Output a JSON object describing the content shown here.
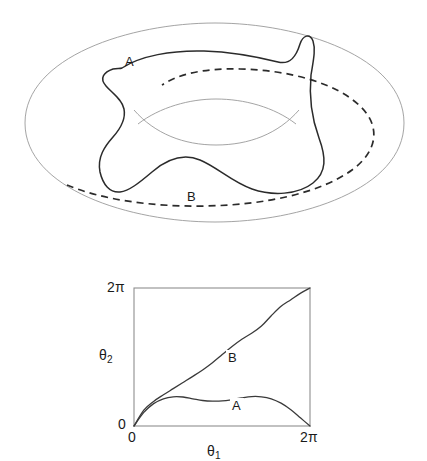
{
  "figure": {
    "title": "",
    "panels": [
      {
        "id": "torus-panel",
        "kind": "torus-diagram",
        "description": "Torus surface with two closed loops drawn on it",
        "curves": [
          {
            "id": "A",
            "label": "A",
            "style": "solid",
            "label_x": 128,
            "label_y": 62
          },
          {
            "id": "B",
            "label": "B",
            "style": "dashed",
            "label_x": 190,
            "label_y": 197
          }
        ]
      },
      {
        "id": "plot-panel",
        "kind": "square-plot",
        "curves": [
          {
            "id": "A",
            "label": "A",
            "label_x": 233,
            "label_y": 404
          },
          {
            "id": "B",
            "label": "B",
            "label_x": 229,
            "label_y": 357
          }
        ]
      }
    ]
  },
  "plot": {
    "x_axis_label_base": "θ",
    "x_axis_label_sub": "1",
    "y_axis_label_base": "θ",
    "y_axis_label_sub": "2",
    "x_ticks": [
      "0",
      "2π"
    ],
    "y_ticks": [
      "0",
      "2π"
    ],
    "x_tick_origin": "0",
    "x_tick_max": "2π",
    "y_tick_origin": "0",
    "y_tick_max": "2π"
  },
  "colors": {
    "background": "#ffffff",
    "torus_outline": "#9a9a9a",
    "curve_solid": "#2b2b2b",
    "curve_dashed": "#2b2b2b",
    "plot_frame": "#8f8f8f",
    "plot_curve": "#3a3a3a",
    "text": "#1a1a1a"
  },
  "chart_data": {
    "type": "line",
    "title": "",
    "xlabel": "θ₁",
    "ylabel": "θ₂",
    "xlim": [
      0,
      6.2832
    ],
    "ylim": [
      0,
      6.2832
    ],
    "xticks": [
      0,
      6.2832
    ],
    "xticklabels": [
      "0",
      "2π"
    ],
    "yticks": [
      0,
      6.2832
    ],
    "yticklabels": [
      "0",
      "2π"
    ],
    "grid": false,
    "legend": "inline-annotation",
    "series": [
      {
        "name": "A",
        "label": "A",
        "annotation_at": [
          3.6,
          1.05
        ],
        "comment": "contractible-type loop: rises, wobbles, returns to 0 at 2pi",
        "x": [
          0.0,
          0.35,
          0.7,
          1.05,
          1.4,
          1.75,
          2.1,
          2.45,
          2.8,
          3.15,
          3.5,
          3.85,
          4.2,
          4.55,
          4.9,
          5.25,
          5.6,
          5.95,
          6.2832
        ],
        "y": [
          0.0,
          0.62,
          1.02,
          1.24,
          1.33,
          1.32,
          1.24,
          1.16,
          1.13,
          1.14,
          1.2,
          1.28,
          1.34,
          1.33,
          1.24,
          1.04,
          0.74,
          0.36,
          0.0
        ]
      },
      {
        "name": "B",
        "label": "B",
        "annotation_at": [
          3.45,
          3.05
        ],
        "comment": "(1,1) winding loop: monotone from (0,0) to (2pi,2pi) with inflections",
        "x": [
          0.0,
          0.35,
          0.7,
          1.05,
          1.4,
          1.75,
          2.1,
          2.45,
          2.8,
          3.15,
          3.5,
          3.85,
          4.2,
          4.55,
          4.9,
          5.25,
          5.6,
          5.95,
          6.2832
        ],
        "y": [
          0.0,
          0.72,
          1.12,
          1.42,
          1.7,
          1.98,
          2.26,
          2.55,
          2.88,
          3.25,
          3.62,
          3.95,
          4.22,
          4.55,
          5.02,
          5.45,
          5.75,
          6.05,
          6.2832
        ]
      }
    ]
  }
}
